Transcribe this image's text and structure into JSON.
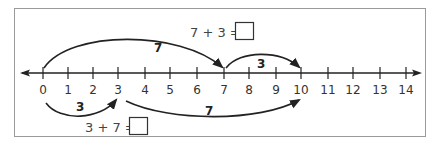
{
  "number_line": {
    "min": 0,
    "max": 14,
    "ticks": [
      "0",
      "1",
      "2",
      "3",
      "4",
      "5",
      "6",
      "7",
      "8",
      "9",
      "10",
      "11",
      "12",
      "13",
      "14"
    ],
    "arrows_both_ends": true
  },
  "equations": {
    "top": {
      "text": "7 + 3 =",
      "answer_box": ""
    },
    "bottom": {
      "text": "3 + 7 =",
      "answer_box": ""
    }
  },
  "jumps": {
    "top": [
      {
        "from": 0,
        "to": 7,
        "label": "7"
      },
      {
        "from": 7,
        "to": 10,
        "label": "3"
      }
    ],
    "bottom": [
      {
        "from": 0,
        "to": 3,
        "label": "3"
      },
      {
        "from": 3,
        "to": 10,
        "label": "7"
      }
    ]
  },
  "colors": {
    "line": "#222222",
    "border": "#999999",
    "text": "#333333"
  }
}
